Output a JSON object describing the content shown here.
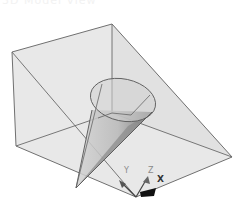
{
  "header": {
    "title": "3D Model View"
  },
  "viewport": {
    "background": "#ffffff",
    "box": {
      "fill": "#e6e6e6",
      "edge_color": "#6f6f6f",
      "vertices": {
        "top_left": [
          12,
          52
        ],
        "top_back": [
          112,
          24
        ],
        "right_tip": [
          232,
          157
        ],
        "bottom_left": [
          16,
          146
        ],
        "bottom_front": [
          136,
          197
        ],
        "inner_back": [
          112,
          113
        ]
      }
    },
    "cone": {
      "ellipse_center": [
        123,
        100
      ],
      "ellipse_rx": 33,
      "ellipse_ry": 21,
      "apex": [
        76,
        188
      ],
      "fill": "#bdbdbd",
      "shade": "#7a7a7a"
    },
    "gizmo": {
      "origin": [
        136,
        197
      ],
      "labels": {
        "x": "X",
        "y": "Y",
        "z": "Z"
      }
    }
  }
}
